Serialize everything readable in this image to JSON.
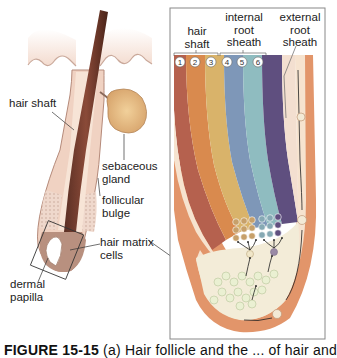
{
  "left_panel": {
    "labels": {
      "hair_shaft": "hair shaft",
      "sebaceous_gland": [
        "sebaceous",
        "gland"
      ],
      "follicular_bulge": [
        "follicular",
        "bulge"
      ],
      "hair_matrix_cells": [
        "hair matrix",
        "cells"
      ],
      "dermal_papilla": [
        "dermal",
        "papilla"
      ]
    }
  },
  "right_panel": {
    "headers": {
      "hair_shaft": [
        "hair",
        "shaft"
      ],
      "internal_root_sheath": [
        "internal",
        "root",
        "sheath"
      ],
      "external_root_sheath": [
        "external",
        "root",
        "sheath"
      ]
    },
    "layer_numbers": [
      "1",
      "2",
      "3",
      "4",
      "5",
      "6"
    ],
    "layer_colors": [
      "#b5614e",
      "#d98a4e",
      "#d9b36a",
      "#7e97b8",
      "#8fbcc0",
      "#5f4f7f"
    ],
    "outer_sheath_color": "#e2956a"
  },
  "caption": {
    "figure": "FIGURE 15-15",
    "text": "(a) Hair follicle and the ... of hair and"
  }
}
